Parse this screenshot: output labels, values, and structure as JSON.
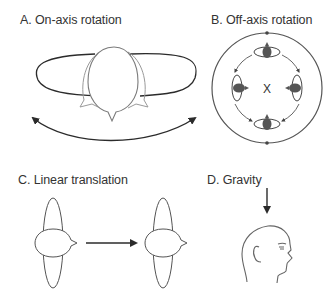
{
  "panels": [
    {
      "id": "A",
      "label": "A. On-axis rotation"
    },
    {
      "id": "B",
      "label": "B. Off-axis rotation",
      "center_marker": "X"
    },
    {
      "id": "C",
      "label": "C. Linear translation"
    },
    {
      "id": "D",
      "label": "D. Gravity"
    }
  ],
  "colors": {
    "stroke_dark": "#2b2b2b",
    "stroke_grey": "#8a8a8a",
    "fill_dark": "#555555",
    "text": "#333333"
  }
}
